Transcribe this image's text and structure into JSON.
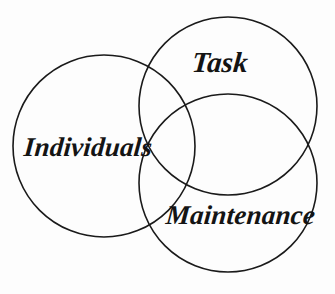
{
  "diagram": {
    "type": "venn",
    "title": "",
    "background_color": "#fdfdfd",
    "stroke_color": "#1a1a1a",
    "text_color": "#141414",
    "circles": [
      {
        "id": "individuals",
        "label": "Individuals",
        "cx": 104,
        "cy": 146,
        "r": 91
      },
      {
        "id": "task",
        "label": "Task",
        "cx": 228,
        "cy": 106,
        "r": 89
      },
      {
        "id": "maintenance",
        "label": "Maintenance",
        "cx": 228,
        "cy": 183,
        "r": 89
      }
    ]
  }
}
